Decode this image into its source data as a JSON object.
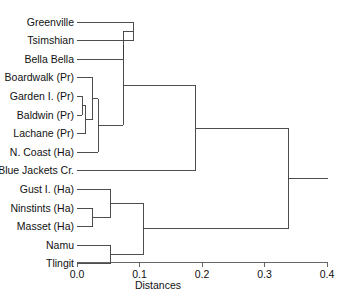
{
  "chart_data": {
    "type": "dendrogram",
    "title": "",
    "xlabel": "Distances",
    "ylabel": "",
    "xlim": [
      0.0,
      0.4
    ],
    "xticks": [
      0.0,
      0.1,
      0.2,
      0.3,
      0.4
    ],
    "xtick_labels": [
      "0.0",
      "0.1",
      "0.2",
      "0.3",
      "0.4"
    ],
    "grid": false,
    "legend": "none",
    "orientation": "horizontal",
    "leaves": [
      "Greenville",
      "Tsimshian",
      "Bella Bella",
      "Boardwalk (Pr)",
      "Garden I. (Pr)",
      "Baldwin (Pr)",
      "Lachane (Pr)",
      "N. Coast (Ha)",
      "Blue Jackets Cr.",
      "Gust I. (Ha)",
      "Ninstints (Ha)",
      "Masset (Ha)",
      "Namu",
      "Tlingit"
    ],
    "merges": [
      {
        "id": "m1",
        "members": [
          "Garden I. (Pr)",
          "Baldwin (Pr)"
        ],
        "distance": 0.008
      },
      {
        "id": "m2",
        "members": [
          "m1",
          "Lachane (Pr)"
        ],
        "distance": 0.014
      },
      {
        "id": "m3",
        "members": [
          "Boardwalk (Pr)",
          "m2"
        ],
        "distance": 0.025
      },
      {
        "id": "m4",
        "members": [
          "m3",
          "N. Coast (Ha)"
        ],
        "distance": 0.034
      },
      {
        "id": "m5",
        "members": [
          "Greenville",
          "Tsimshian"
        ],
        "distance": 0.09
      },
      {
        "id": "m6",
        "members": [
          "m5",
          "Bella Bella"
        ],
        "distance": 0.074
      },
      {
        "id": "m7",
        "members": [
          "m6",
          "m4"
        ],
        "distance": 0.074
      },
      {
        "id": "m8",
        "members": [
          "Ninstints (Ha)",
          "Masset (Ha)"
        ],
        "distance": 0.025
      },
      {
        "id": "m9",
        "members": [
          "Gust I. (Ha)",
          "m8"
        ],
        "distance": 0.054
      },
      {
        "id": "m10",
        "members": [
          "Namu",
          "Tlingit"
        ],
        "distance": 0.054
      },
      {
        "id": "m11",
        "members": [
          "m9",
          "m10"
        ],
        "distance": 0.106
      },
      {
        "id": "m12",
        "members": [
          "m7",
          "Blue Jackets Cr."
        ],
        "distance": 0.19
      },
      {
        "id": "m13",
        "members": [
          "m12",
          "m11"
        ],
        "distance": 0.338
      }
    ]
  },
  "axis": {
    "title": "Distances",
    "ticks": [
      "0.0",
      "0.1",
      "0.2",
      "0.3",
      "0.4"
    ]
  },
  "colors": {
    "background": "#ffffff",
    "branch": "#3a3a3a",
    "axis": "#555555",
    "text": "#111111"
  }
}
